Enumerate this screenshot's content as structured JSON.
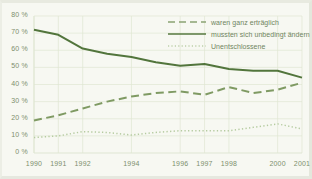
{
  "chart_data": {
    "type": "line",
    "title": "",
    "subtitle": "",
    "xlabel": "",
    "ylabel": "",
    "grid": true,
    "legend_position": "top-right",
    "ylim": [
      0,
      80
    ],
    "y_ticks": [
      0,
      10,
      20,
      30,
      40,
      50,
      60,
      70,
      80
    ],
    "y_tick_labels": [
      "0 %",
      "10 %",
      "20 %",
      "30 %",
      "40 %",
      "50 %",
      "60 %",
      "70 %",
      "80 %"
    ],
    "x": [
      1990,
      1991,
      1992,
      1993,
      1994,
      1995,
      1996,
      1997,
      1998,
      1999,
      2000,
      2001
    ],
    "x_tick_labels": [
      "1990",
      "1991",
      "1992",
      "1994",
      "1996",
      "1997",
      "1998",
      "2000",
      "2001"
    ],
    "x_ticks_shown": [
      1990,
      1991,
      1992,
      1994,
      1996,
      1997,
      1998,
      2000,
      2001
    ],
    "series": [
      {
        "name": "waren ganz erträglich",
        "style": "dashed",
        "color": "#7f9a63",
        "values": [
          19,
          22,
          26,
          30,
          33,
          35,
          36,
          34,
          38.5,
          35,
          37,
          41
        ]
      },
      {
        "name": "mussten sich unbedingt ändern",
        "style": "solid",
        "color": "#52753c",
        "values": [
          72,
          69,
          61,
          58,
          56,
          53,
          51,
          52,
          49,
          48,
          48,
          44
        ]
      },
      {
        "name": "Unentschlossene",
        "style": "dotted",
        "color": "#b5cba0",
        "values": [
          9,
          10,
          12.5,
          12,
          10.5,
          12,
          13,
          13,
          13,
          15,
          17,
          14
        ]
      }
    ]
  },
  "legend": {
    "items": [
      {
        "label": "waren ganz erträglich"
      },
      {
        "label": "mussten sich unbedingt ändern"
      },
      {
        "label": "Unentschlossene"
      }
    ]
  },
  "colors": {
    "series_dashed": "#7f9a63",
    "series_solid": "#52753c",
    "series_dotted": "#b5cba0",
    "grid": "#dfe6d3",
    "axis_text": "#7d8f6d",
    "background": "#f7f8f2"
  }
}
